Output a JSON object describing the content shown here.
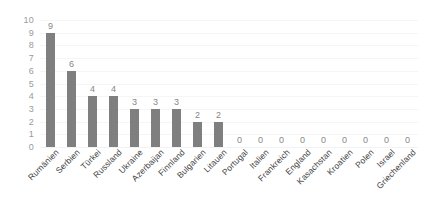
{
  "chart_data": {
    "type": "bar",
    "title": "",
    "subtitle": "",
    "xlabel": "",
    "ylabel": "",
    "ylim": [
      0,
      10
    ],
    "ytick_step": 1,
    "yticks": [
      "10",
      "9",
      "8",
      "7",
      "6",
      "5",
      "4",
      "3",
      "2",
      "1",
      "0"
    ],
    "grid": true,
    "legend": false,
    "legend_position": "none",
    "bar_color": "#7f7f7f",
    "data_label_color": "#878787",
    "axis_label_color": "#9a9a9a",
    "category_label_color": "#3f3f3f",
    "gridline_color": "#f4f5f7",
    "background": "#ffffff",
    "show_data_labels": true,
    "categories": [
      "Rumänien",
      "Serbien",
      "Türkei",
      "Russland",
      "Ukraine",
      "Azerbaijan",
      "Finnland",
      "Bulgarien",
      "Litauen",
      "Portugal",
      "Italien",
      "Frankreich",
      "England",
      "Kasachstan",
      "Kroatien",
      "Polen",
      "Israel",
      "Griechenland"
    ],
    "values": [
      9,
      6,
      4,
      4,
      3,
      3,
      3,
      2,
      2,
      0,
      0,
      0,
      0,
      0,
      0,
      0,
      0,
      0
    ],
    "data_labels": [
      "9",
      "6",
      "4",
      "4",
      "3",
      "3",
      "3",
      "2",
      "2",
      "0",
      "0",
      "0",
      "0",
      "0",
      "0",
      "0",
      "0",
      "0"
    ]
  }
}
